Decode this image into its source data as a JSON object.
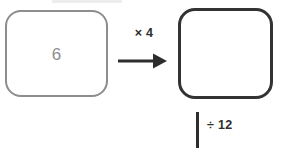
{
  "diagram": {
    "type": "function-machine-flow",
    "background_color": "#ffffff",
    "input_box": {
      "value": "6",
      "border_color": "#8d8d8d",
      "text_color": "#8d8d8d",
      "filled": true
    },
    "output_box": {
      "value": "",
      "border_color": "#333333",
      "filled": false
    },
    "operations": [
      {
        "name": "multiply",
        "label": "× 4",
        "direction": "right",
        "color": "#2d2d2d"
      },
      {
        "name": "divide",
        "label": "÷ 12",
        "direction": "down",
        "color": "#2d2d2d"
      }
    ]
  }
}
